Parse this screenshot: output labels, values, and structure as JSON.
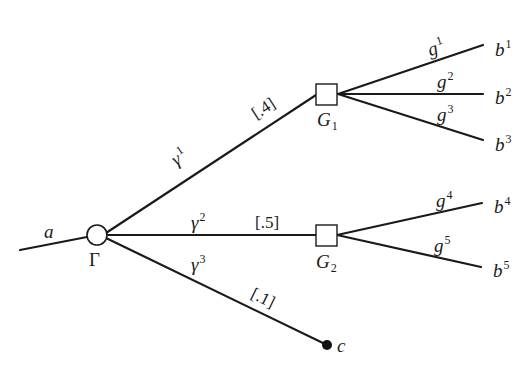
{
  "diagram": {
    "type": "decision-tree",
    "colors": {
      "line": "#1a1a1a",
      "background": "#ffffff",
      "terminal_dot": "#111111"
    },
    "root_edge": {
      "label": "a"
    },
    "chance_node": {
      "label": "Γ"
    },
    "branches": [
      {
        "id": "gamma1",
        "label": "γ",
        "sup": "1",
        "probability": "[.4]",
        "target": "G1"
      },
      {
        "id": "gamma2",
        "label": "γ",
        "sup": "2",
        "probability": "[.5]",
        "target": "G2"
      },
      {
        "id": "gamma3",
        "label": "γ",
        "sup": "3",
        "probability": "[.1]",
        "target": "c"
      }
    ],
    "decision_nodes": [
      {
        "id": "G1",
        "label": "G",
        "sub": "1",
        "edges": [
          {
            "label": "g",
            "sup": "1",
            "outcome": "b",
            "outcome_sup": "1"
          },
          {
            "label": "g",
            "sup": "2",
            "outcome": "b",
            "outcome_sup": "2"
          },
          {
            "label": "g",
            "sup": "3",
            "outcome": "b",
            "outcome_sup": "3"
          }
        ]
      },
      {
        "id": "G2",
        "label": "G",
        "sub": "2",
        "edges": [
          {
            "label": "g",
            "sup": "4",
            "outcome": "b",
            "outcome_sup": "4"
          },
          {
            "label": "g",
            "sup": "5",
            "outcome": "b",
            "outcome_sup": "5"
          }
        ]
      }
    ],
    "terminal": {
      "label": "c"
    }
  }
}
